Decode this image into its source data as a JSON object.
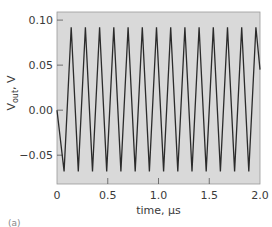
{
  "chart_data": {
    "type": "line",
    "title": "",
    "xlabel": "time, µs",
    "ylabel": "V_out, V",
    "ylabel_main": "V",
    "ylabel_sub": "out",
    "ylabel_suffix": ", V",
    "xlim": [
      0,
      2.0
    ],
    "ylim": [
      -0.082,
      0.109
    ],
    "x_ticks": [
      0,
      0.5,
      1.0,
      1.5,
      2.0
    ],
    "x_tick_labels": [
      "0",
      "0.5",
      "1.0",
      "1.5",
      "2.0"
    ],
    "y_ticks": [
      0.1,
      0.05,
      0.0,
      -0.05
    ],
    "y_tick_labels": [
      "0.10",
      "0.05",
      "0.00",
      "−0.05"
    ],
    "grid": false,
    "legend": null,
    "background": "#d9d9d9",
    "line_color": "#2b2b2b",
    "waveform": "triangle",
    "peak_value": 0.092,
    "trough_value": -0.068,
    "period_us": 0.14,
    "series": [
      {
        "name": "V_out",
        "x": [
          0,
          0.07,
          0.14,
          0.21,
          0.28,
          0.35,
          0.42,
          0.49,
          0.56,
          0.63,
          0.7,
          0.77,
          0.84,
          0.91,
          0.98,
          1.05,
          1.12,
          1.19,
          1.26,
          1.33,
          1.4,
          1.47,
          1.54,
          1.61,
          1.68,
          1.75,
          1.82,
          1.89,
          1.96,
          2.0
        ],
        "y": [
          0.0,
          -0.068,
          0.092,
          -0.068,
          0.092,
          -0.068,
          0.092,
          -0.068,
          0.092,
          -0.068,
          0.092,
          -0.068,
          0.092,
          -0.068,
          0.092,
          -0.068,
          0.092,
          -0.068,
          0.092,
          -0.068,
          0.092,
          -0.068,
          0.092,
          -0.068,
          0.092,
          -0.068,
          0.092,
          -0.068,
          0.092,
          0.045
        ]
      }
    ]
  },
  "panel_label": "(a)"
}
